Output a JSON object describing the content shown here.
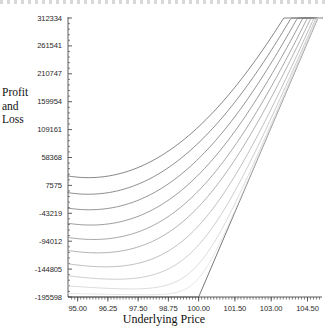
{
  "chart_data": {
    "type": "line",
    "title": "",
    "xlabel": "Underlying Price",
    "ylabel": "Profit and Loss",
    "ylabel_lines": [
      "Profit",
      "and",
      "Loss"
    ],
    "xlim": [
      94.6,
      105.1
    ],
    "ylim": [
      -195598,
      312334
    ],
    "grid": false,
    "legend": false,
    "xticks": [
      95.0,
      96.25,
      97.5,
      98.75,
      100.0,
      101.5,
      103.0,
      104.5
    ],
    "xtick_labels": [
      "95.00",
      "96.25",
      "97.50",
      "98.75",
      "100.00",
      "101.50",
      "103.00",
      "104.50"
    ],
    "yticks": [
      312334,
      261541,
      210747,
      159954,
      109161,
      58368,
      7575,
      -43219,
      -94012,
      -144805,
      -195598
    ],
    "ytick_labels": [
      "312334",
      "261541",
      "210747",
      "159954",
      "109161",
      "58368",
      "7575",
      "-43219",
      "-94012",
      "-144805",
      "-195598"
    ],
    "ytick_step": 50793,
    "minor_ticks": true,
    "strike": 100.0,
    "series": [
      {
        "name": "expiry",
        "color": "#555555",
        "kink_x": 100.0,
        "floor_y": -195598,
        "slope_per_unit": 103000,
        "shape": "kinked-line"
      },
      {
        "name": "t10",
        "color": "#5a5a5a",
        "shape": "smoothed",
        "decay": 0.0,
        "left_y": -41000
      },
      {
        "name": "t9",
        "color": "#636363",
        "shape": "smoothed",
        "decay": 0.1,
        "left_y": -57000
      },
      {
        "name": "t8",
        "color": "#6d6d6d",
        "shape": "smoothed",
        "decay": 0.2,
        "left_y": -72000
      },
      {
        "name": "t7",
        "color": "#787878",
        "shape": "smoothed",
        "decay": 0.3,
        "left_y": -88000
      },
      {
        "name": "t6",
        "color": "#878787",
        "shape": "smoothed",
        "decay": 0.4,
        "left_y": -104000
      },
      {
        "name": "t5",
        "color": "#969696",
        "shape": "smoothed",
        "decay": 0.5,
        "left_y": -120000
      },
      {
        "name": "t4",
        "color": "#a8a8a8",
        "shape": "smoothed",
        "decay": 0.62,
        "left_y": -138000
      },
      {
        "name": "t3",
        "color": "#bbbbbb",
        "shape": "smoothed",
        "decay": 0.74,
        "left_y": -157000
      },
      {
        "name": "t2",
        "color": "#cfcfcf",
        "shape": "smoothed",
        "decay": 0.86,
        "left_y": -175000
      },
      {
        "name": "t1",
        "color": "#dedede",
        "shape": "smoothed",
        "decay": 0.95,
        "left_y": -189000
      }
    ],
    "converge_x": 104.9,
    "converge_y_top": 312334
  },
  "axes": {
    "axis_color": "#4a4a4a",
    "tick_color": "#4a4a4a",
    "plot_left": 68,
    "plot_right": 322,
    "plot_top": 18,
    "plot_bottom": 297
  }
}
